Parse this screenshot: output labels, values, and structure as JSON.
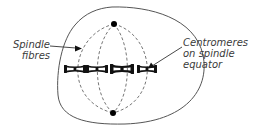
{
  "diagram": {
    "labels": {
      "spindle_fibres": {
        "lines": [
          "Spindle",
          "fibres"
        ]
      },
      "centromeres": {
        "lines": [
          "Centromeres",
          "on spindle",
          "equator"
        ]
      }
    },
    "colors": {
      "outline": "#555555",
      "fibre": "#666666",
      "chromosome": "#111111",
      "pole": "#000000",
      "text": "#3a3a3a"
    },
    "poles": [
      {
        "name": "top-pole",
        "x": 114,
        "y": 24
      },
      {
        "name": "bottom-pole",
        "x": 113,
        "y": 113
      }
    ],
    "chromosomes": [
      {
        "x": 75,
        "y": 69
      },
      {
        "x": 97,
        "y": 69
      },
      {
        "x": 122,
        "y": 69
      },
      {
        "x": 147,
        "y": 69
      }
    ]
  }
}
